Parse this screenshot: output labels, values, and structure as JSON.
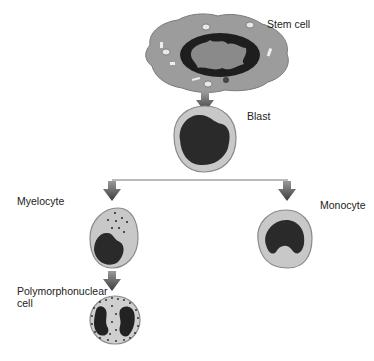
{
  "diagram": {
    "nodes": [
      {
        "id": "stem",
        "label": "Stem cell"
      },
      {
        "id": "blast",
        "label": "Blast"
      },
      {
        "id": "myelocyte",
        "label": "Myelocyte"
      },
      {
        "id": "monocyte",
        "label": "Monocyte"
      },
      {
        "id": "pmn",
        "label": "Polymorphonuclear\ncell"
      }
    ],
    "edges": [
      {
        "from": "stem",
        "to": "blast"
      },
      {
        "from": "blast",
        "to": "myelocyte"
      },
      {
        "from": "blast",
        "to": "monocyte"
      },
      {
        "from": "myelocyte",
        "to": "pmn"
      }
    ],
    "colors": {
      "cytoplasm": "#c8c8c8",
      "stem_cytoplasm": "#9a9a9a",
      "nucleus": "#2a2a2a",
      "arrow": "#555555",
      "outline": "#8a8a8a"
    }
  }
}
